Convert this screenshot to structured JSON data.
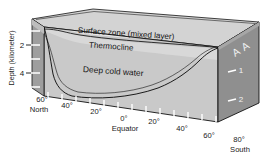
{
  "figure": {
    "kind": "ocean-thermal-structure-block-diagram",
    "background_color": "#ffffff"
  },
  "axes": {
    "depth": {
      "label": "Depth (kilometer)",
      "unit": "kilometer",
      "ticks_left": [
        "2",
        "4"
      ],
      "ticks_right": [
        "1",
        "2"
      ]
    },
    "latitude": {
      "front_left_labels": [
        "60°",
        "40°",
        "20°",
        "0°"
      ],
      "front_right_labels": [
        "20°",
        "40°",
        "60°",
        "80°"
      ],
      "hemisphere_left": "North",
      "hemisphere_right": "South",
      "equator_label": "Equator"
    }
  },
  "layers": [
    {
      "id": "surface-zone",
      "label": "Surface zone (mixed layer)",
      "color": "#e8e8e8"
    },
    {
      "id": "thermocline",
      "label": "Thermocline",
      "color": "#d8d8d8"
    },
    {
      "id": "deep-cold-water",
      "label": "Deep cold water",
      "color": "#c9c9c9"
    }
  ],
  "side_face": {
    "label": "A A",
    "color": "#8f8f8f"
  },
  "colors": {
    "top_face": "#d3d3d3",
    "front_face": "#c9c9c9",
    "right_face": "#8f8f8f",
    "left_face": "#9e9e9e",
    "outline": "#111111",
    "tick_white": "#ffffff",
    "text": "#1a1a1a"
  }
}
